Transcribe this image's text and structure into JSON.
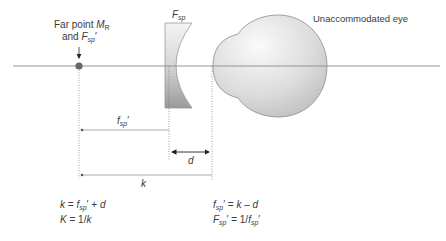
{
  "diagram": {
    "title_labels": {
      "far_point_line1_prefix": "Far point ",
      "far_point_symbol": "M",
      "far_point_symbol_sub": "R",
      "far_point_line2_prefix": "and ",
      "far_point_line2_symbol": "F",
      "far_point_line2_sub": "sp",
      "far_point_line2_suffix": "′",
      "lens_label": "F",
      "lens_label_sub": "sp",
      "eye_label": "Unaccommodated eye"
    },
    "dimensions": {
      "fsp_label": "f",
      "fsp_label_sub": "sp",
      "fsp_label_suffix": "′",
      "d_label": "d",
      "k_label": "k"
    },
    "formulas": {
      "left": [
        {
          "lhs": "k",
          "eq": " = ",
          "rhs_sym": "f",
          "rhs_sub": "sp",
          "rhs_rest": "′ + ",
          "rhs_tail": "d"
        },
        {
          "lhs": "K",
          "eq": " = 1/",
          "rhs_sym": "k",
          "rhs_sub": "",
          "rhs_rest": "",
          "rhs_tail": ""
        }
      ],
      "right": [
        {
          "lhs": "f",
          "lhs_sub": "sp",
          "lhs_rest": "′ = ",
          "rhs1": "k",
          "rhs_mid": " – ",
          "rhs2": "d"
        },
        {
          "lhs": "F",
          "lhs_sub": "sp",
          "lhs_rest": "′ = 1/",
          "rhs1": "f",
          "rhs_mid_sub": "sp",
          "rhs2": "′"
        }
      ]
    },
    "colors": {
      "axis": "#8a8a8a",
      "lens_fill_top": "#f2f2f2",
      "lens_fill_bottom": "#9a9a9a",
      "eye_fill_light": "#f4f4f4",
      "eye_fill_dark": "#c8c8c8",
      "dot": "#666666"
    }
  }
}
